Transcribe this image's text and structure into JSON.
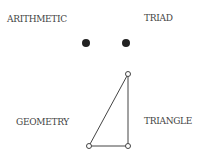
{
  "labels": {
    "top_left": "ARITHMETIC",
    "top_right": "TRIAD",
    "bottom_left": "GEOMETRY",
    "bottom_right": "TRIANGLE"
  },
  "dots": [
    {
      "x": 86,
      "y": 43
    },
    {
      "x": 126,
      "y": 43
    }
  ],
  "triangle": {
    "vertices": [
      {
        "x": 128,
        "y": 74
      },
      {
        "x": 89,
        "y": 146
      },
      {
        "x": 128,
        "y": 146
      }
    ]
  },
  "colors": {
    "ink": "#333333"
  }
}
